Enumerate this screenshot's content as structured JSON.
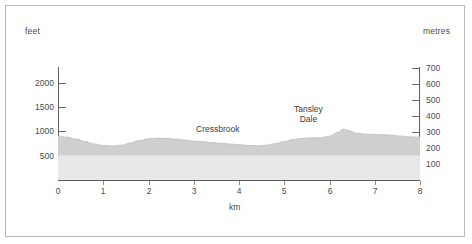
{
  "axes": {
    "left_unit": "feet",
    "right_unit": "metres",
    "x_unit": "km",
    "left_ticks": [
      {
        "label": "2000",
        "value": 2000
      },
      {
        "label": "1500",
        "value": 1500
      },
      {
        "label": "1000",
        "value": 1000
      },
      {
        "label": "500",
        "value": 500
      }
    ],
    "right_ticks": [
      {
        "label": "700",
        "value": 700
      },
      {
        "label": "600",
        "value": 600
      },
      {
        "label": "500",
        "value": 500
      },
      {
        "label": "400",
        "value": 400
      },
      {
        "label": "300",
        "value": 300
      },
      {
        "label": "200",
        "value": 200
      },
      {
        "label": "100",
        "value": 100
      }
    ],
    "x_ticks": [
      "0",
      "1",
      "2",
      "3",
      "4",
      "5",
      "6",
      "7",
      "8"
    ]
  },
  "annotations": [
    {
      "name": "cressbrook",
      "lines": [
        "Cressbrook"
      ],
      "km": 3.85
    },
    {
      "name": "tansley-dale",
      "lines": [
        "Tansley",
        "Dale"
      ],
      "km": 5.7
    }
  ],
  "colors": {
    "terrain_upper": "#cfcfcf",
    "terrain_lower": "#e8e8e8",
    "axis": "#5d5d5d",
    "frame": "#b9b9b9",
    "text": "#4a4a4a"
  },
  "chart_data": {
    "type": "area",
    "title": "",
    "subtitle": "",
    "xlabel": "km",
    "ylabel": "feet",
    "ylabel_secondary": "metres",
    "xlim": [
      0,
      8
    ],
    "ylim": [
      0,
      2300
    ],
    "ylim_secondary": [
      0,
      700
    ],
    "grid": false,
    "legend_position": "none",
    "band_split_feet": 500,
    "series": [
      {
        "name": "Elevation profile",
        "x": [
          0.0,
          0.2,
          0.4,
          0.6,
          0.8,
          1.0,
          1.2,
          1.4,
          1.6,
          1.8,
          2.0,
          2.2,
          2.4,
          2.6,
          2.8,
          3.0,
          3.2,
          3.4,
          3.6,
          3.8,
          4.0,
          4.2,
          4.4,
          4.6,
          4.8,
          5.0,
          5.2,
          5.4,
          5.6,
          5.8,
          6.0,
          6.2,
          6.3,
          6.4,
          6.6,
          6.8,
          7.0,
          7.2,
          7.4,
          7.6,
          7.8,
          8.0
        ],
        "y": [
          900,
          880,
          840,
          790,
          740,
          710,
          700,
          715,
          760,
          810,
          845,
          860,
          855,
          840,
          820,
          800,
          785,
          770,
          755,
          740,
          725,
          712,
          705,
          715,
          745,
          790,
          830,
          855,
          865,
          870,
          900,
          980,
          1045,
          1020,
          960,
          940,
          935,
          930,
          920,
          900,
          885,
          880
        ],
        "unit": "feet"
      }
    ],
    "annotations": [
      {
        "text": "Cressbrook",
        "x_km": 3.85,
        "y_feet": 980
      },
      {
        "text": "Tansley Dale",
        "x_km": 5.7,
        "y_feet": 1250
      }
    ]
  }
}
